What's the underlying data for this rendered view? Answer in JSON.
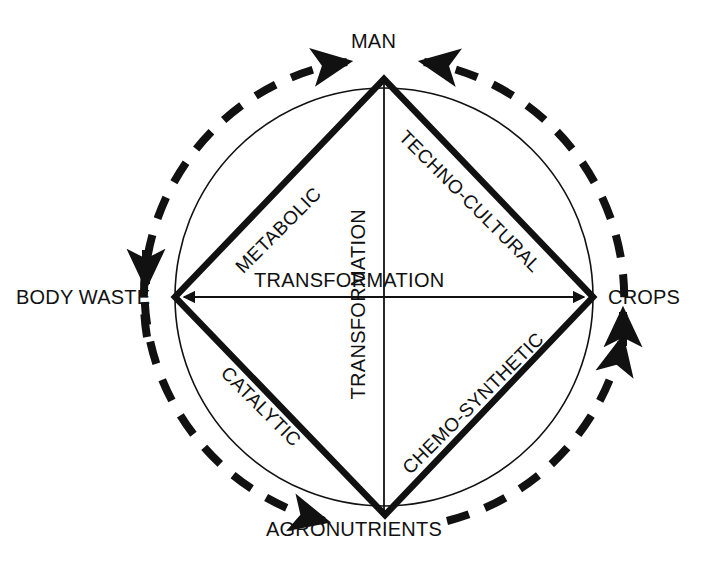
{
  "diagram": {
    "colors": {
      "stroke": "#111111",
      "thin_circle": "#111111",
      "background": "#ffffff"
    },
    "nodes": [
      {
        "id": "man",
        "label": "MAN",
        "position": "top"
      },
      {
        "id": "crops",
        "label": "CROPS",
        "position": "right"
      },
      {
        "id": "agronutrients",
        "label": "AGRONUTRIENTS",
        "position": "bottom"
      },
      {
        "id": "body_waste",
        "label": "BODY WASTE",
        "position": "left"
      }
    ],
    "edges": [
      {
        "id": "metabolic",
        "label": "METABOLIC",
        "from": "man",
        "to": "body_waste",
        "side": "upper-left",
        "rotation": -45
      },
      {
        "id": "techno_cultural",
        "label": "TECHNO-CULTURAL",
        "from": "man",
        "to": "crops",
        "side": "upper-right",
        "rotation": 45
      },
      {
        "id": "catalytic",
        "label": "CATALYTIC",
        "from": "body_waste",
        "to": "agronutrients",
        "side": "lower-left",
        "rotation": 45
      },
      {
        "id": "chemo_synthetic",
        "label": "CHEMO-SYNTHETIC",
        "from": "agronutrients",
        "to": "crops",
        "side": "lower-right",
        "rotation": -45
      }
    ],
    "axes": [
      {
        "id": "horizontal_axis",
        "label": "TRANSFORMATION",
        "orientation": "horizontal",
        "arrowheads": "both"
      },
      {
        "id": "vertical_axis",
        "label": "TRANSFORMATION",
        "orientation": "vertical",
        "arrowheads": "none"
      }
    ],
    "flow": {
      "style": "dashed-circle",
      "direction": "counterclockwise",
      "arrows": [
        {
          "id": "flow-arrow-man",
          "points_to": "MAN",
          "heading": "left"
        },
        {
          "id": "flow-arrow-body-waste",
          "points_to": "BODY WASTE",
          "heading": "down"
        },
        {
          "id": "flow-arrow-agronutrients",
          "points_to": "AGRONUTRIENTS",
          "heading": "down-right"
        },
        {
          "id": "flow-arrow-crops",
          "points_to": "CROPS",
          "heading": "up"
        }
      ]
    }
  }
}
